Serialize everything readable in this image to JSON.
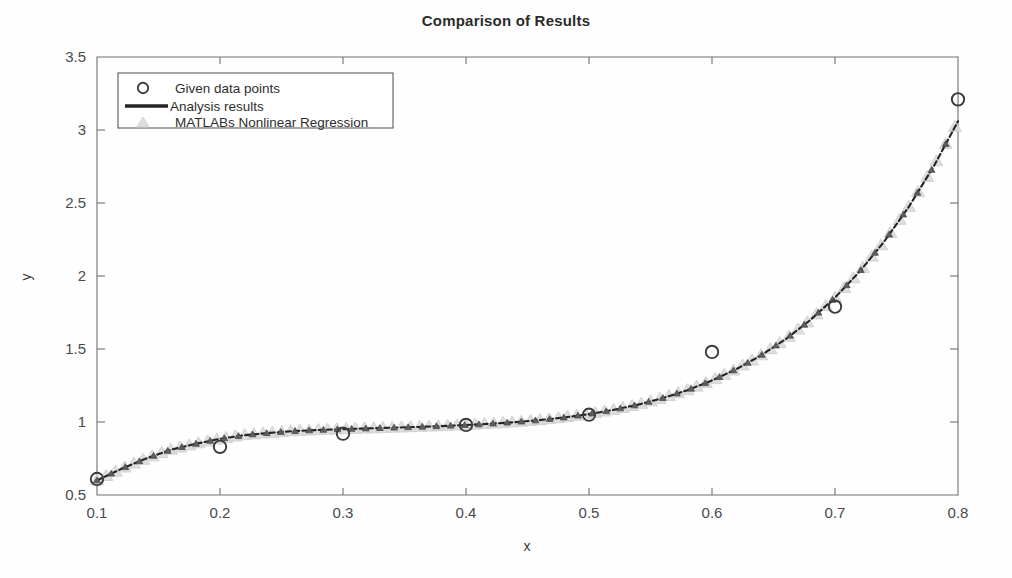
{
  "chart_data": {
    "type": "scatter",
    "title": "Comparison of Results",
    "xlabel": "x",
    "ylabel": "y",
    "xlim": [
      0.1,
      0.8
    ],
    "ylim": [
      0.5,
      3.5
    ],
    "xticks": [
      "0.1",
      "0.2",
      "0.3",
      "0.4",
      "0.5",
      "0.6",
      "0.7",
      "0.8"
    ],
    "xtick_values": [
      0.1,
      0.2,
      0.3,
      0.4,
      0.5,
      0.6,
      0.7,
      0.8
    ],
    "yticks": [
      "0.5",
      "1",
      "1.5",
      "2",
      "2.5",
      "3",
      "3.5"
    ],
    "ytick_values": [
      0.5,
      1.0,
      1.5,
      2.0,
      2.5,
      3.0,
      3.5
    ],
    "grid": false,
    "legend_position": "upper left",
    "series": [
      {
        "name": "Given data points",
        "marker": "circle",
        "style": "markers",
        "color": "#3b3b3b",
        "x": [
          0.1,
          0.2,
          0.3,
          0.4,
          0.5,
          0.6,
          0.7,
          0.8
        ],
        "values": [
          0.61,
          0.83,
          0.92,
          0.98,
          1.05,
          1.48,
          1.79,
          3.21
        ]
      },
      {
        "name": "Analysis results",
        "marker": "none",
        "style": "line",
        "color": "#242424",
        "x": [
          0.1,
          0.12,
          0.14,
          0.16,
          0.18,
          0.2,
          0.22,
          0.24,
          0.26,
          0.28,
          0.3,
          0.32,
          0.34,
          0.36,
          0.38,
          0.4,
          0.42,
          0.44,
          0.46,
          0.48,
          0.5,
          0.52,
          0.54,
          0.56,
          0.58,
          0.6,
          0.62,
          0.64,
          0.66,
          0.68,
          0.7,
          0.72,
          0.74,
          0.76,
          0.78,
          0.8
        ],
        "values": [
          0.6,
          0.68,
          0.75,
          0.81,
          0.85,
          0.885,
          0.91,
          0.925,
          0.938,
          0.945,
          0.951,
          0.956,
          0.961,
          0.966,
          0.972,
          0.979,
          0.988,
          0.999,
          1.013,
          1.031,
          1.054,
          1.083,
          1.119,
          1.164,
          1.218,
          1.284,
          1.363,
          1.457,
          1.568,
          1.699,
          1.852,
          2.03,
          2.236,
          2.474,
          2.747,
          3.06
        ]
      },
      {
        "name": "MATLABs Nonlinear Regression",
        "marker": "triangle",
        "style": "markers",
        "color": "#dcdcdc",
        "x": [
          0.1,
          0.12,
          0.14,
          0.16,
          0.18,
          0.2,
          0.22,
          0.24,
          0.26,
          0.28,
          0.3,
          0.32,
          0.34,
          0.36,
          0.38,
          0.4,
          0.42,
          0.44,
          0.46,
          0.48,
          0.5,
          0.52,
          0.54,
          0.56,
          0.58,
          0.6,
          0.62,
          0.64,
          0.66,
          0.68,
          0.7,
          0.72,
          0.74,
          0.76,
          0.78,
          0.8
        ],
        "values": [
          0.6,
          0.68,
          0.75,
          0.81,
          0.85,
          0.885,
          0.91,
          0.925,
          0.938,
          0.945,
          0.951,
          0.956,
          0.961,
          0.966,
          0.972,
          0.979,
          0.988,
          0.999,
          1.013,
          1.031,
          1.054,
          1.083,
          1.119,
          1.164,
          1.218,
          1.284,
          1.363,
          1.457,
          1.568,
          1.699,
          1.852,
          2.03,
          2.236,
          2.474,
          2.747,
          3.06
        ]
      }
    ]
  },
  "legend": {
    "items": [
      {
        "label": "Given data points",
        "icon": "circle-marker-icon"
      },
      {
        "label": "Analysis results",
        "icon": "line-sample-icon"
      },
      {
        "label": "MATLABs Nonlinear Regression",
        "icon": "triangle-marker-icon"
      }
    ]
  }
}
